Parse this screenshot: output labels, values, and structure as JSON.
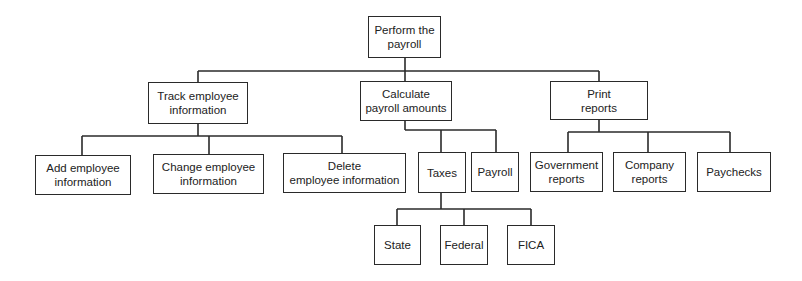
{
  "diagram": {
    "type": "hierarchy-chart",
    "colors": {
      "line": "#2a2a2a",
      "box_fill": "#ffffff",
      "text": "#222222"
    },
    "nodes": [
      {
        "id": "root",
        "label": "Perform the payroll",
        "lines": [
          "Perform the",
          "payroll"
        ],
        "box": [
          368,
          16,
          73,
          42
        ],
        "parent": null
      },
      {
        "id": "track",
        "label": "Track employee information",
        "lines": [
          "Track employee",
          "information"
        ],
        "box": [
          148,
          82,
          100,
          42
        ],
        "parent": "root"
      },
      {
        "id": "calculate",
        "label": "Calculate payroll amounts",
        "lines": [
          "Calculate",
          "payroll amounts"
        ],
        "box": [
          360,
          81,
          92,
          40
        ],
        "parent": "root"
      },
      {
        "id": "print",
        "label": "Print reports",
        "lines": [
          "Print",
          "reports"
        ],
        "box": [
          550,
          81,
          98,
          39
        ],
        "parent": "root"
      },
      {
        "id": "add",
        "label": "Add employee information",
        "lines": [
          "Add employee",
          "information"
        ],
        "box": [
          35,
          155,
          96,
          40
        ],
        "parent": "track"
      },
      {
        "id": "change",
        "label": "Change employee information",
        "lines": [
          "Change employee",
          "information"
        ],
        "box": [
          153,
          154,
          111,
          40
        ],
        "parent": "track"
      },
      {
        "id": "delete",
        "label": "Delete employee information",
        "lines": [
          "Delete",
          "employee information"
        ],
        "box": [
          283,
          153,
          123,
          40
        ],
        "parent": "track"
      },
      {
        "id": "taxes",
        "label": "Taxes",
        "lines": [
          "Taxes"
        ],
        "box": [
          418,
          152,
          48,
          41
        ],
        "parent": "calculate"
      },
      {
        "id": "payroll",
        "label": "Payroll",
        "lines": [
          "Payroll"
        ],
        "box": [
          471,
          152,
          48,
          40
        ],
        "parent": "calculate"
      },
      {
        "id": "government",
        "label": "Government reports",
        "lines": [
          "Government",
          "reports"
        ],
        "box": [
          530,
          152,
          73,
          40
        ],
        "parent": "print"
      },
      {
        "id": "company",
        "label": "Company reports",
        "lines": [
          "Company",
          "reports"
        ],
        "box": [
          613,
          152,
          73,
          40
        ],
        "parent": "print"
      },
      {
        "id": "paychecks",
        "label": "Paychecks",
        "lines": [
          "Paychecks"
        ],
        "box": [
          697,
          152,
          74,
          40
        ],
        "parent": "print"
      },
      {
        "id": "state",
        "label": "State",
        "lines": [
          "State"
        ],
        "box": [
          374,
          225,
          47,
          40
        ],
        "parent": "taxes"
      },
      {
        "id": "federal",
        "label": "Federal",
        "lines": [
          "Federal"
        ],
        "box": [
          440,
          225,
          48,
          40
        ],
        "parent": "taxes"
      },
      {
        "id": "fica",
        "label": "FICA",
        "lines": [
          "FICA"
        ],
        "box": [
          507,
          225,
          48,
          40
        ],
        "parent": "taxes"
      }
    ],
    "connectors": [
      {
        "from": "root",
        "points": [
          [
            405,
            58
          ],
          [
            405,
            71
          ]
        ],
        "bus": [
          [
            198,
            71
          ],
          [
            599,
            71
          ]
        ],
        "drops": [
          [
            198,
            71,
            82
          ],
          [
            405,
            71,
            81
          ],
          [
            599,
            71,
            81
          ]
        ]
      },
      {
        "from": "track",
        "points": [
          [
            198,
            124
          ],
          [
            198,
            136
          ]
        ],
        "bus": [
          [
            82,
            136
          ],
          [
            342,
            136
          ]
        ],
        "drops": [
          [
            82,
            136,
            155
          ],
          [
            209,
            136,
            154
          ],
          [
            342,
            136,
            153
          ]
        ]
      },
      {
        "from": "calculate",
        "points": [
          [
            405,
            121
          ],
          [
            405,
            130
          ]
        ],
        "bus": [
          [
            405,
            130
          ],
          [
            496,
            130
          ]
        ],
        "drops": [
          [
            441,
            130,
            152
          ],
          [
            496,
            130,
            152
          ]
        ]
      },
      {
        "from": "print",
        "points": [
          [
            599,
            120
          ],
          [
            599,
            132
          ]
        ],
        "bus": [
          [
            568,
            132
          ],
          [
            730,
            132
          ]
        ],
        "drops": [
          [
            568,
            132,
            152
          ],
          [
            648,
            132,
            152
          ],
          [
            730,
            132,
            152
          ]
        ]
      },
      {
        "from": "taxes",
        "points": [
          [
            441,
            193
          ],
          [
            441,
            209
          ]
        ],
        "bus": [
          [
            397,
            209
          ],
          [
            531,
            209
          ]
        ],
        "drops": [
          [
            397,
            209,
            225
          ],
          [
            464,
            209,
            225
          ],
          [
            531,
            209,
            225
          ]
        ]
      }
    ]
  }
}
